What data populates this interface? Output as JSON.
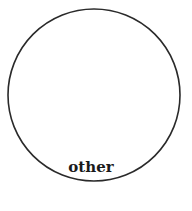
{
  "diagram": {
    "shape": "circle",
    "label": "other",
    "stroke_color": "#2a2a2a",
    "fill_color": "#ffffff"
  }
}
